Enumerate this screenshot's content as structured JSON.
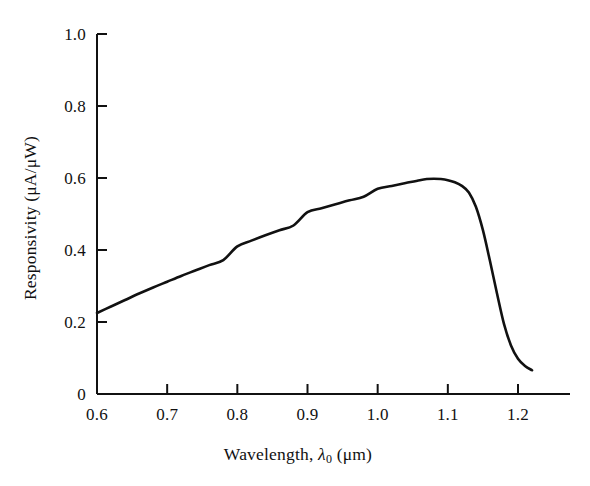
{
  "chart_data": {
    "type": "line",
    "title": "",
    "subtitle": "",
    "xlabel": "Wavelength, λ₀ (μm)",
    "ylabel": "Responsivity (μA/μW)",
    "xlim": [
      0.6,
      1.24
    ],
    "ylim": [
      0,
      1.0
    ],
    "xticks": [
      0.6,
      0.7,
      0.8,
      0.9,
      1.0,
      1.1,
      1.2
    ],
    "xtick_labels": [
      "0.6",
      "0.7",
      "0.8",
      "0.9",
      "1.0",
      "1.1",
      "1.2"
    ],
    "yticks": [
      0,
      0.2,
      0.4,
      0.6,
      0.8,
      1.0
    ],
    "ytick_labels": [
      "0",
      "0.2",
      "0.4",
      "0.6",
      "0.8",
      "1.0"
    ],
    "grid": false,
    "legend": false,
    "legend_position": "none",
    "line_color": "#111111",
    "line_width": 2.6,
    "background_color": "#ffffff",
    "axis_color": "#111111",
    "series": [
      {
        "name": "Silicon photodiode responsivity",
        "x": [
          0.6,
          0.62,
          0.64,
          0.66,
          0.68,
          0.7,
          0.72,
          0.74,
          0.76,
          0.78,
          0.8,
          0.82,
          0.84,
          0.86,
          0.88,
          0.9,
          0.92,
          0.94,
          0.96,
          0.98,
          1.0,
          1.02,
          1.04,
          1.06,
          1.07,
          1.08,
          1.09,
          1.1,
          1.11,
          1.12,
          1.13,
          1.14,
          1.15,
          1.16,
          1.17,
          1.18,
          1.19,
          1.2,
          1.21,
          1.22
        ],
        "y": [
          0.225,
          0.243,
          0.261,
          0.279,
          0.296,
          0.312,
          0.328,
          0.343,
          0.358,
          0.372,
          0.41,
          0.426,
          0.441,
          0.455,
          0.468,
          0.505,
          0.516,
          0.527,
          0.538,
          0.548,
          0.57,
          0.578,
          0.586,
          0.594,
          0.597,
          0.598,
          0.597,
          0.594,
          0.588,
          0.578,
          0.56,
          0.52,
          0.455,
          0.37,
          0.28,
          0.195,
          0.135,
          0.098,
          0.078,
          0.066
        ]
      }
    ],
    "annotations": []
  },
  "axes": {
    "x_title": "Wavelength,",
    "x_symbol": "λ",
    "x_symbol_sub": "0",
    "x_unit": "(μm)",
    "y_title": "Responsivity (μA/μW)"
  }
}
